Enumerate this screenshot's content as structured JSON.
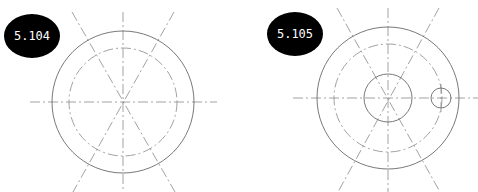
{
  "figures": [
    {
      "label": "5.104",
      "badge": {
        "cx": 32,
        "cy": 36,
        "rx": 28,
        "ry": 22,
        "color": "#000000"
      },
      "center": {
        "x": 123,
        "y": 102
      },
      "outer_circle_r": 71,
      "bolt_circle_r": 54,
      "centerlines": {
        "horizontal": [
          30,
          217
        ],
        "vertical": [
          12,
          192
        ],
        "diagonals": [
          [
            72,
            12,
            175,
            192
          ],
          [
            174,
            12,
            73,
            192
          ]
        ]
      }
    },
    {
      "label": "5.105",
      "badge": {
        "cx": 295,
        "cy": 34,
        "rx": 28,
        "ry": 22,
        "color": "#000000"
      },
      "center": {
        "x": 388,
        "y": 98
      },
      "outer_circle_r": 71,
      "bolt_circle_r": 54,
      "hole_r": 24,
      "small_hole": {
        "cx": 441,
        "cy": 98,
        "r": 10
      },
      "centerlines": {
        "horizontal": [
          293,
          478
        ],
        "vertical": [
          8,
          192
        ],
        "diagonals": [
          [
            337,
            8,
            440,
            192
          ],
          [
            439,
            8,
            338,
            192
          ]
        ]
      }
    }
  ]
}
